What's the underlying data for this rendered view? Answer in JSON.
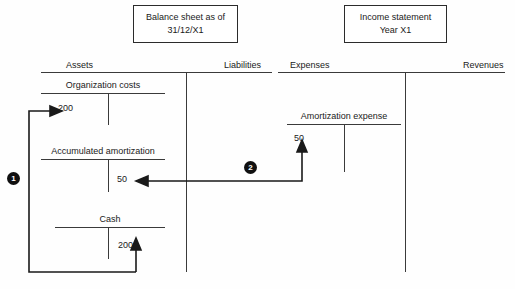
{
  "diagram": {
    "title_boxes": [
      {
        "name": "balance-sheet",
        "line1": "Balance sheet as of",
        "line2": "31/12/X1"
      },
      {
        "name": "income-statement",
        "line1": "Income statement",
        "line2": "Year X1"
      }
    ],
    "column_headers": [
      {
        "name": "assets",
        "label": "Assets"
      },
      {
        "name": "liabilities",
        "label": "Liabilities"
      },
      {
        "name": "expenses",
        "label": "Expenses"
      },
      {
        "name": "revenues",
        "label": "Revenues"
      }
    ],
    "accounts": [
      {
        "name": "organization-costs",
        "title": "Organization costs",
        "side": "assets",
        "debit": "200",
        "credit": ""
      },
      {
        "name": "accumulated-amortization",
        "title": "Accumulated amortization",
        "side": "assets",
        "debit": "",
        "credit": "50"
      },
      {
        "name": "cash",
        "title": "Cash",
        "side": "assets",
        "debit": "",
        "credit": "200"
      },
      {
        "name": "amortization-expense",
        "title": "Amortization expense",
        "side": "expenses",
        "debit": "50",
        "credit": ""
      }
    ],
    "flow_markers": [
      {
        "name": "flow-1",
        "label": "1"
      },
      {
        "name": "flow-2",
        "label": "2"
      }
    ],
    "colors": {
      "ink": "#1a1a1a",
      "rule": "#3a3a3a",
      "marker_fill": "#101010",
      "marker_text": "#ffffff",
      "background": "#fefefe"
    }
  }
}
